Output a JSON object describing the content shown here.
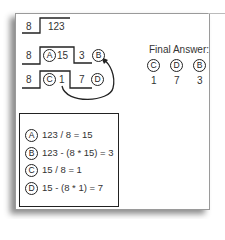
{
  "diagram": {
    "steps": [
      {
        "divisor": "8",
        "dividend": "123"
      },
      {
        "divisor": "8",
        "quotient_label": "A",
        "quotient": "15",
        "remainder": "3",
        "remainder_label": "B"
      },
      {
        "divisor": "8",
        "quotient_label": "C",
        "quotient": "1",
        "remainder": "7",
        "remainder_label": "D"
      }
    ],
    "arrow": {
      "from": "C",
      "to": "B"
    },
    "final_answer": {
      "title": "Final Answer:",
      "digits": [
        {
          "label": "C",
          "value": "1"
        },
        {
          "label": "D",
          "value": "7"
        },
        {
          "label": "B",
          "value": "3"
        }
      ]
    },
    "legend": [
      {
        "label": "A",
        "equation": "123 / 8 = 15"
      },
      {
        "label": "B",
        "equation": "123 - (8 * 15) = 3"
      },
      {
        "label": "C",
        "equation": "15 / 8 = 1"
      },
      {
        "label": "D",
        "equation": "15 - (8 * 1) = 7"
      }
    ],
    "colors": {
      "ink": "#222222",
      "paper": "#ffffff",
      "border": "#9a9a9a"
    }
  }
}
